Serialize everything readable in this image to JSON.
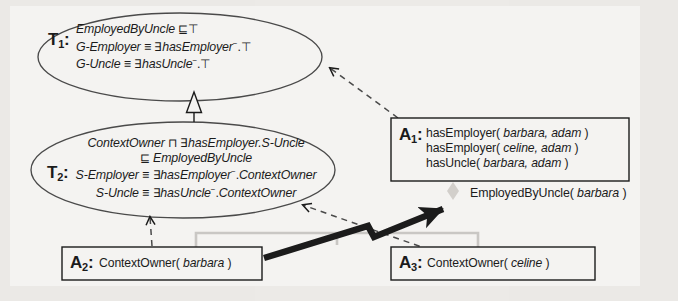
{
  "diagram": {
    "background_color": "#f4f3f1",
    "ink_color": "#1b1b1b",
    "faint_color": "#c9c7c4"
  },
  "tboxes": [
    {
      "id": "T1",
      "label": "T",
      "subscript": "1",
      "colon": ":",
      "lines": [
        {
          "parts": [
            {
              "t": "EmployedByUncle",
              "style": "italic"
            },
            {
              "t": " ⊑⊤",
              "style": "op"
            }
          ]
        },
        {
          "parts": [
            {
              "t": "G-Employer",
              "style": "italic"
            },
            {
              "t": " ≡ ",
              "style": "op"
            },
            {
              "t": "∃",
              "style": "op"
            },
            {
              "t": "hasEmployer",
              "style": "italic"
            },
            {
              "t": "−",
              "style": "inv"
            },
            {
              "t": ".⊤",
              "style": "op"
            }
          ]
        },
        {
          "parts": [
            {
              "t": "G-Uncle",
              "style": "italic"
            },
            {
              "t": " ≡ ",
              "style": "op"
            },
            {
              "t": "∃",
              "style": "op"
            },
            {
              "t": "hasUncle",
              "style": "italic"
            },
            {
              "t": "−",
              "style": "inv"
            },
            {
              "t": ".⊤",
              "style": "op"
            }
          ]
        }
      ]
    },
    {
      "id": "T2",
      "label": "T",
      "subscript": "2",
      "colon": ":",
      "lines": [
        {
          "parts": [
            {
              "t": "ContextOwner",
              "style": "italic"
            },
            {
              "t": " ⊓ ",
              "style": "op"
            },
            {
              "t": "∃",
              "style": "op"
            },
            {
              "t": "hasEmployer.S-Uncle",
              "style": "italic"
            }
          ]
        },
        {
          "parts": [
            {
              "t": "⊑ ",
              "style": "op"
            },
            {
              "t": "EmployedByUncle",
              "style": "italic"
            }
          ]
        },
        {
          "parts": [
            {
              "t": "S-Employer",
              "style": "italic"
            },
            {
              "t": " ≡ ",
              "style": "op"
            },
            {
              "t": "∃",
              "style": "op"
            },
            {
              "t": "hasEmployer",
              "style": "italic"
            },
            {
              "t": "−",
              "style": "inv"
            },
            {
              "t": ".",
              "style": "op"
            },
            {
              "t": "ContextOwner",
              "style": "italic"
            }
          ]
        },
        {
          "parts": [
            {
              "t": "S-Uncle",
              "style": "italic"
            },
            {
              "t": " ≡ ",
              "style": "op"
            },
            {
              "t": "∃",
              "style": "op"
            },
            {
              "t": "hasUncle",
              "style": "italic"
            },
            {
              "t": "−",
              "style": "inv"
            },
            {
              "t": ".",
              "style": "op"
            },
            {
              "t": "ContextOwner",
              "style": "italic"
            }
          ]
        }
      ]
    }
  ],
  "aboxes": [
    {
      "id": "A1",
      "label": "A",
      "subscript": "1",
      "colon": ":",
      "lines": [
        {
          "parts": [
            {
              "t": "hasEmployer( ",
              "style": "normal"
            },
            {
              "t": "barbara, adam",
              "style": "italic"
            },
            {
              "t": " )",
              "style": "normal"
            }
          ]
        },
        {
          "parts": [
            {
              "t": "hasEmployer( ",
              "style": "normal"
            },
            {
              "t": "celine, adam",
              "style": "italic"
            },
            {
              "t": " )",
              "style": "normal"
            }
          ]
        },
        {
          "parts": [
            {
              "t": "hasUncle( ",
              "style": "normal"
            },
            {
              "t": "barbara, adam",
              "style": "italic"
            },
            {
              "t": " )",
              "style": "normal"
            }
          ]
        }
      ]
    },
    {
      "id": "A2",
      "label": "A",
      "subscript": "2",
      "colon": ":",
      "lines": [
        {
          "parts": [
            {
              "t": "ContextOwner( ",
              "style": "normal"
            },
            {
              "t": "barbara",
              "style": "italic"
            },
            {
              "t": " )",
              "style": "normal"
            }
          ]
        }
      ]
    },
    {
      "id": "A3",
      "label": "A",
      "subscript": "3",
      "colon": ":",
      "lines": [
        {
          "parts": [
            {
              "t": "ContextOwner( ",
              "style": "normal"
            },
            {
              "t": "celine",
              "style": "italic"
            },
            {
              "t": " )",
              "style": "normal"
            }
          ]
        }
      ]
    }
  ],
  "entailment": {
    "parts": [
      {
        "t": "EmployedByUncle( ",
        "style": "normal"
      },
      {
        "t": "barbara",
        "style": "italic"
      },
      {
        "t": " )",
        "style": "normal"
      }
    ],
    "plain": "EmployedByUncle( barbara )"
  },
  "connectors": [
    {
      "name": "t2-subsumes-t1",
      "from": "T2",
      "to": "T1",
      "style": "solid",
      "head": "hollow-triangle"
    },
    {
      "name": "a1-asserts-into-t1",
      "from": "A1",
      "to": "T1",
      "style": "dashed",
      "head": "open-arrow"
    },
    {
      "name": "a2-asserts-into-t2",
      "from": "A2",
      "to": "T2",
      "style": "dashed",
      "head": "open-arrow"
    },
    {
      "name": "a3-asserts-into-t2",
      "from": "A3",
      "to": "T2",
      "style": "dashed",
      "head": "open-arrow"
    },
    {
      "name": "entailment-arrow",
      "from": "A2",
      "to": "entailment",
      "style": "thick-solid",
      "head": "filled-arrow"
    },
    {
      "name": "abox-group-bracket",
      "from": "A2",
      "to": "A3",
      "style": "faint-bracket",
      "head": "none"
    }
  ]
}
